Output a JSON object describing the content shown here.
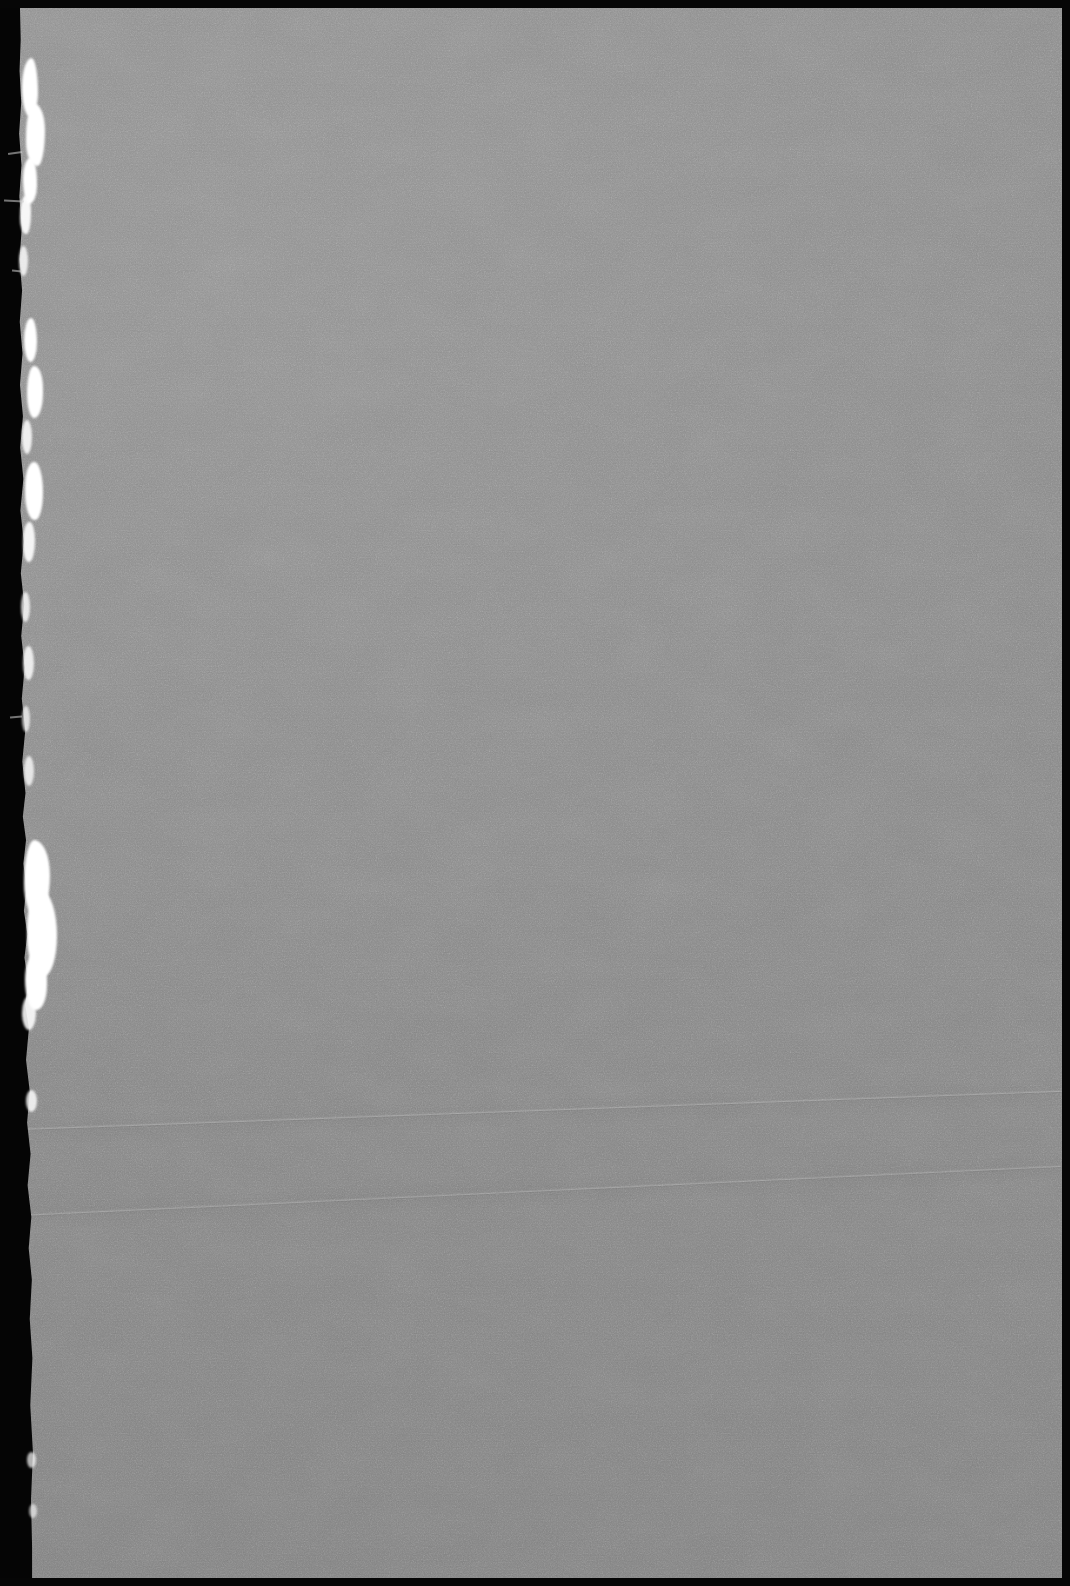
{
  "document": {
    "kind": "scanned-page",
    "description": "Blank scanned page, grayscale",
    "content_text": "",
    "page_width_px": 1070,
    "page_height_px": 1586,
    "has_visible_text": "no",
    "has_visible_graphics": "no"
  },
  "colors": {
    "paper_base": "#878787",
    "paper_light": "#939393",
    "paper_dark": "#7b7b7b",
    "backing_black": "#050505",
    "torn_fiber_white": "#ffffff",
    "crease_highlight": "#b4b4b4"
  },
  "sheet": {
    "offset_left_px": 20,
    "offset_top_px": 8,
    "width_px": 1042,
    "height_px": 1570,
    "left_edge_type": "torn",
    "right_edge_type": "straight",
    "top_edge_type": "straight",
    "bottom_edge_type": "straight"
  },
  "artifacts": {
    "creases": [
      {
        "name": "upper-crease",
        "top_px": 1120,
        "angle_deg": -2.1,
        "tone": "light"
      },
      {
        "name": "lower-crease",
        "top_px": 1206,
        "angle_deg": -2.7,
        "tone": "light"
      }
    ],
    "torn_edge_clusters": [
      {
        "name": "upper-cluster",
        "y_from_px": 55,
        "y_to_px": 300
      },
      {
        "name": "mid-cluster",
        "y_from_px": 310,
        "y_to_px": 560
      },
      {
        "name": "sparse-cluster",
        "y_from_px": 580,
        "y_to_px": 800
      },
      {
        "name": "bright-patch",
        "y_from_px": 840,
        "y_to_px": 1010
      },
      {
        "name": "lower-specks",
        "y_from_px": 1090,
        "y_to_px": 1520
      }
    ],
    "grain": "fine-paper-noise",
    "banding": "horizontal-scan-lines"
  }
}
